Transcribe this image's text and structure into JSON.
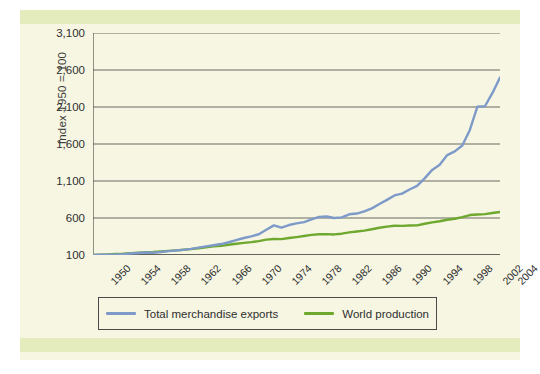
{
  "figure": {
    "background": "#f6f6e3",
    "band_color": "#e4ecbd"
  },
  "chart_data": {
    "type": "line",
    "title": "",
    "xlabel": "",
    "ylabel": "Index 1950 = 100",
    "xlim": [
      1950,
      2004
    ],
    "ylim": [
      100,
      3100
    ],
    "yticks": [
      100,
      600,
      1100,
      1600,
      2100,
      2600,
      3100
    ],
    "ytick_labels": [
      "100",
      "600",
      "1,100",
      "1,600",
      "2,100",
      "2,600",
      "3,100"
    ],
    "xticks": [
      1950,
      1954,
      1958,
      1962,
      1966,
      1970,
      1974,
      1978,
      1982,
      1986,
      1990,
      1994,
      1998,
      2002,
      2004
    ],
    "xtick_labels": [
      "1950",
      "1954",
      "1958",
      "1962",
      "1966",
      "1970",
      "1974",
      "1978",
      "1982",
      "1986",
      "1990",
      "1994",
      "1998",
      "2002",
      "2004"
    ],
    "minor_xticks_every": 1,
    "grid": "horizontal",
    "legend_position": "below-axes",
    "x": [
      1950,
      1951,
      1952,
      1953,
      1954,
      1955,
      1956,
      1957,
      1958,
      1959,
      1960,
      1961,
      1962,
      1963,
      1964,
      1965,
      1966,
      1967,
      1968,
      1969,
      1970,
      1971,
      1972,
      1973,
      1974,
      1975,
      1976,
      1977,
      1978,
      1979,
      1980,
      1981,
      1982,
      1983,
      1984,
      1985,
      1986,
      1987,
      1988,
      1989,
      1990,
      1991,
      1992,
      1993,
      1994,
      1995,
      1996,
      1997,
      1998,
      1999,
      2000,
      2001,
      2002,
      2003,
      2004
    ],
    "series": [
      {
        "name": "Total merchandise exports",
        "color": "#7d9ac9",
        "values": [
          100,
          104,
          105,
          107,
          112,
          120,
          128,
          133,
          130,
          140,
          152,
          160,
          170,
          182,
          200,
          216,
          232,
          248,
          272,
          300,
          330,
          352,
          380,
          440,
          500,
          470,
          505,
          528,
          545,
          580,
          615,
          620,
          600,
          608,
          650,
          660,
          690,
          730,
          790,
          845,
          905,
          930,
          985,
          1035,
          1135,
          1250,
          1320,
          1450,
          1500,
          1580,
          1790,
          2105,
          2110,
          2290,
          2500
        ]
      },
      {
        "name": "World production",
        "color": "#6fa82e",
        "values": [
          100,
          105,
          108,
          113,
          118,
          126,
          132,
          137,
          140,
          148,
          156,
          163,
          171,
          180,
          192,
          204,
          216,
          224,
          238,
          252,
          264,
          274,
          288,
          308,
          316,
          314,
          330,
          342,
          356,
          372,
          380,
          382,
          378,
          388,
          406,
          418,
          430,
          448,
          468,
          484,
          496,
          494,
          498,
          500,
          522,
          540,
          556,
          576,
          590,
          612,
          640,
          648,
          652,
          668,
          682
        ]
      }
    ]
  },
  "axis": {
    "ylabel_text": "Index 1950 = 100"
  },
  "legend": {
    "items": [
      {
        "label": "Total merchandise exports",
        "color": "#7d9ac9"
      },
      {
        "label": "World production",
        "color": "#6fa82e"
      }
    ]
  }
}
